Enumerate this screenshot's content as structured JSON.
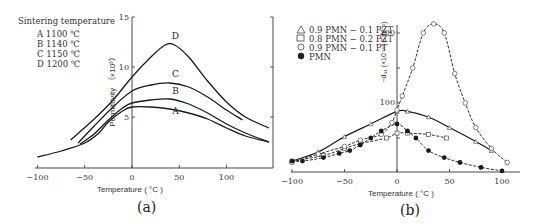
{
  "chart_data": [
    {
      "type": "line",
      "panel": "(a)",
      "title": "",
      "legend_title": "Sintering temperature",
      "xlabel": "Temperature ( °C )",
      "ylabel": "Permittivity (×10³)",
      "xlim": [
        -100,
        150
      ],
      "ylim": [
        0,
        15
      ],
      "xticks": [
        -100,
        -50,
        0,
        50,
        100
      ],
      "yticks": [
        5,
        10,
        15
      ],
      "grid": false,
      "legend_position": "upper left",
      "series": [
        {
          "name": "A",
          "label": "A  1100 ℃",
          "x": [
            -100,
            -75,
            -50,
            -35,
            -25,
            -10,
            0,
            20,
            40,
            60,
            80,
            100,
            120,
            145
          ],
          "y": [
            1.0,
            1.6,
            2.4,
            3.4,
            4.5,
            5.6,
            6.0,
            6.0,
            5.8,
            5.4,
            4.8,
            3.9,
            3.1,
            2.5
          ]
        },
        {
          "name": "B",
          "label": "B  1140 ℃",
          "x": [
            -55,
            -40,
            -25,
            -10,
            0,
            20,
            40,
            60,
            80,
            100,
            120,
            145
          ],
          "y": [
            2.3,
            3.3,
            4.7,
            5.9,
            6.4,
            6.7,
            6.8,
            6.3,
            5.4,
            4.3,
            3.4,
            2.5
          ]
        },
        {
          "name": "C",
          "label": "C  1150 ℃",
          "x": [
            -57,
            -40,
            -20,
            0,
            20,
            40,
            60,
            80,
            100,
            117
          ],
          "y": [
            2.4,
            4.1,
            6.0,
            7.6,
            8.2,
            8.4,
            8.0,
            7.0,
            5.7,
            4.7
          ]
        },
        {
          "name": "D",
          "label": "D  1200 ℃",
          "x": [
            -65,
            -40,
            -20,
            0,
            20,
            35,
            45,
            60,
            80,
            100,
            120,
            145
          ],
          "y": [
            2.7,
            4.8,
            6.7,
            9.0,
            11.0,
            12.2,
            12.2,
            11.0,
            8.6,
            6.5,
            5.0,
            3.9
          ]
        }
      ],
      "curve_labels": [
        {
          "text": "D",
          "x": 46,
          "y": 12.8
        },
        {
          "text": "C",
          "x": 46,
          "y": 9.0
        },
        {
          "text": "B",
          "x": 46,
          "y": 7.3
        },
        {
          "text": "A",
          "x": 46,
          "y": 5.3
        }
      ],
      "caption": "(a)"
    },
    {
      "type": "line",
      "panel": "(b)",
      "title": "",
      "xlabel": "Temperature ( °C )",
      "ylabel": "-d31 (×10⁻¹² C·N⁻¹)",
      "xlim": [
        -100,
        110
      ],
      "ylim": [
        0,
        220
      ],
      "xticks": [
        -100,
        -50,
        0,
        50,
        100
      ],
      "yticks": [
        100,
        200
      ],
      "grid": false,
      "legend_position": "upper left",
      "series": [
        {
          "name": "0.9 PMN−0.1 PZT",
          "marker": "triangle",
          "x": [
            -100,
            -75,
            -50,
            -25,
            0,
            10,
            30,
            50,
            75,
            90
          ],
          "y": [
            17,
            30,
            52,
            70,
            88,
            88,
            80,
            65,
            45,
            32
          ]
        },
        {
          "name": "0.8 PMN−0.2 PZT",
          "marker": "square",
          "x": [
            -100,
            -70,
            -50,
            -35,
            -10,
            0,
            10,
            30,
            47
          ],
          "y": [
            17,
            25,
            35,
            42,
            50,
            57,
            57,
            55,
            50
          ]
        },
        {
          "name": "0.9 PMN−0.1 PT",
          "marker": "circle-open",
          "x": [
            -100,
            -75,
            -50,
            -35,
            -15,
            -5,
            0,
            5,
            15,
            25,
            35,
            45,
            55,
            65,
            75,
            90,
            105
          ],
          "y": [
            15,
            27,
            38,
            47,
            55,
            72,
            90,
            110,
            150,
            200,
            213,
            200,
            142,
            100,
            65,
            35,
            15
          ]
        },
        {
          "name": "PMN",
          "marker": "circle-filled",
          "x": [
            -100,
            -90,
            -70,
            -55,
            -45,
            -35,
            -25,
            -15,
            0,
            10,
            18,
            30,
            45,
            60,
            80,
            100
          ],
          "y": [
            17,
            17,
            22,
            28,
            32,
            40,
            50,
            60,
            70,
            60,
            50,
            32,
            22,
            15,
            8,
            3
          ]
        }
      ],
      "caption": "(b)"
    }
  ],
  "legend_a": {
    "title": "Sintering temperature",
    "items": [
      "A  1100 ℃",
      "B  1140 ℃",
      "C  1150 ℃",
      "D  1200 ℃"
    ]
  },
  "legend_b": {
    "items": [
      "0.9 PMN − 0.1 PZT",
      "0.8 PMN − 0.2 PZT",
      "0.9 PMN − 0.1 PT",
      "PMN"
    ]
  },
  "axes_a": {
    "xlabel": "Temperature ( °C )",
    "ylabel": "Permittivity （×10³）",
    "xticks": [
      "−100",
      "−50",
      "0",
      "50",
      "100"
    ],
    "yticks": [
      "5",
      "10",
      "15"
    ]
  },
  "axes_b": {
    "xlabel": "Temperature ( °C )",
    "ylabel": "−d₃₁ (×10⁻¹² C·N⁻¹)",
    "xticks": [
      "−100",
      "−50",
      "0",
      "50",
      "100"
    ],
    "yticks": [
      "100",
      "200"
    ]
  },
  "captions": {
    "a": "(a)",
    "b": "(b)"
  }
}
